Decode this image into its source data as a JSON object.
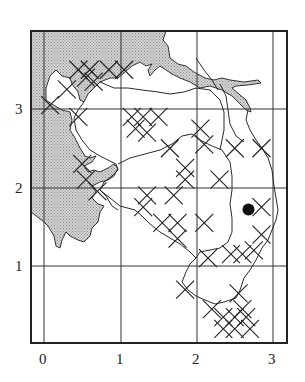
{
  "map": {
    "x_ticks": [
      "0",
      "1",
      "2",
      "3"
    ],
    "y_ticks": [
      "1",
      "2",
      "3"
    ],
    "colors": {
      "frame": "#222222",
      "grid": "#333333",
      "sea": "#c8c8c8",
      "line": "#2a2a2a",
      "marker": "#111111"
    },
    "grid": {
      "x_positions_px": [
        44,
        121,
        197,
        273
      ],
      "y_positions_px": [
        109,
        188,
        266
      ]
    },
    "dot_marker": {
      "x": 2.68,
      "y": 1.72
    },
    "cross_markers": [
      {
        "x": 0.45,
        "y": 3.5
      },
      {
        "x": 0.6,
        "y": 3.5
      },
      {
        "x": 0.55,
        "y": 3.4
      },
      {
        "x": 0.65,
        "y": 3.35
      },
      {
        "x": 0.85,
        "y": 3.5
      },
      {
        "x": 1.05,
        "y": 3.5
      },
      {
        "x": 0.3,
        "y": 3.25
      },
      {
        "x": 0.08,
        "y": 3.05
      },
      {
        "x": 0.45,
        "y": 2.9
      },
      {
        "x": 1.15,
        "y": 2.9
      },
      {
        "x": 1.3,
        "y": 2.9
      },
      {
        "x": 1.5,
        "y": 2.9
      },
      {
        "x": 1.2,
        "y": 2.75
      },
      {
        "x": 1.35,
        "y": 2.7
      },
      {
        "x": 1.65,
        "y": 2.5
      },
      {
        "x": 2.05,
        "y": 2.75
      },
      {
        "x": 2.1,
        "y": 2.55
      },
      {
        "x": 2.5,
        "y": 2.5
      },
      {
        "x": 2.85,
        "y": 2.5
      },
      {
        "x": 1.85,
        "y": 2.25
      },
      {
        "x": 1.85,
        "y": 2.1
      },
      {
        "x": 2.3,
        "y": 2.1
      },
      {
        "x": 0.5,
        "y": 2.3
      },
      {
        "x": 0.55,
        "y": 2.1
      },
      {
        "x": 0.7,
        "y": 1.95
      },
      {
        "x": 1.35,
        "y": 1.9
      },
      {
        "x": 1.3,
        "y": 1.75
      },
      {
        "x": 1.7,
        "y": 1.9
      },
      {
        "x": 1.55,
        "y": 1.55
      },
      {
        "x": 1.75,
        "y": 1.55
      },
      {
        "x": 1.75,
        "y": 1.35
      },
      {
        "x": 2.1,
        "y": 1.55
      },
      {
        "x": 2.85,
        "y": 1.75
      },
      {
        "x": 2.85,
        "y": 1.4
      },
      {
        "x": 2.75,
        "y": 1.2
      },
      {
        "x": 2.6,
        "y": 1.15
      },
      {
        "x": 2.45,
        "y": 1.15
      },
      {
        "x": 2.15,
        "y": 1.1
      },
      {
        "x": 1.85,
        "y": 0.7
      },
      {
        "x": 2.55,
        "y": 0.65
      },
      {
        "x": 2.2,
        "y": 0.45
      },
      {
        "x": 2.35,
        "y": 0.35
      },
      {
        "x": 2.5,
        "y": 0.35
      },
      {
        "x": 2.65,
        "y": 0.35
      },
      {
        "x": 2.5,
        "y": 0.2
      },
      {
        "x": 2.35,
        "y": 0.2
      },
      {
        "x": 2.7,
        "y": 0.2
      },
      {
        "x": 2.6,
        "y": 0.45
      }
    ]
  }
}
